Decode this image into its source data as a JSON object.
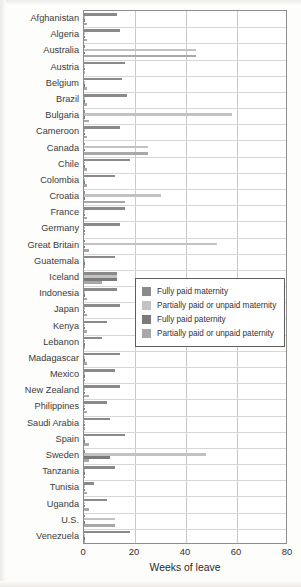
{
  "chart_data": {
    "type": "bar",
    "orientation": "horizontal",
    "title": "",
    "xlabel": "Weeks of leave",
    "ylabel": "",
    "xlim": [
      0,
      80
    ],
    "xticks": [
      0,
      20,
      40,
      60,
      80
    ],
    "grid": true,
    "legend_position": "center-right",
    "categories": [
      "Afghanistan",
      "Algeria",
      "Australia",
      "Austria",
      "Belgium",
      "Brazil",
      "Bulgaria",
      "Cameroon",
      "Canada",
      "Chile",
      "Colombia",
      "Croatia",
      "France",
      "Germany",
      "Great Britain",
      "Guatemala",
      "Iceland",
      "Indonesia",
      "Japan",
      "Kenya",
      "Lebanon",
      "Madagascar",
      "Mexico",
      "New Zealand",
      "Philippines",
      "Saudi Arabia",
      "Spain",
      "Sweden",
      "Tanzania",
      "Tunisia",
      "Uganda",
      "U.S.",
      "Venezuela"
    ],
    "series": [
      {
        "name": "Fully paid maternity",
        "color": "#8a8a8a",
        "values": [
          13,
          14,
          0,
          16,
          15,
          17,
          0,
          14,
          0,
          18,
          12,
          0,
          16,
          14,
          0,
          12,
          13,
          13,
          14,
          9,
          7,
          14,
          12,
          14,
          9,
          10,
          16,
          0,
          12,
          4,
          9,
          0,
          18
        ]
      },
      {
        "name": "Partially paid or unpaid maternity",
        "color": "#c2c2c2",
        "values": [
          0,
          0,
          44,
          0,
          0,
          0,
          58,
          0,
          25,
          0,
          0,
          30,
          0,
          0,
          52,
          0,
          13,
          0,
          0,
          0,
          0,
          0,
          0,
          0,
          0,
          0,
          0,
          48,
          0,
          0,
          0,
          12,
          0
        ]
      },
      {
        "name": "Fully paid paternity",
        "color": "#7a7a7a",
        "values": [
          0,
          0,
          0,
          0,
          0,
          0,
          0,
          0,
          0,
          0,
          0,
          0,
          0,
          0,
          0,
          0,
          13,
          0,
          0,
          0,
          0,
          0,
          0,
          0,
          0,
          0,
          0,
          10,
          0,
          0,
          0,
          0,
          0
        ]
      },
      {
        "name": "Partially paid or unpaid paternity",
        "color": "#a8a8a8",
        "values": [
          1,
          1,
          44,
          0,
          1,
          1,
          2,
          1,
          25,
          1,
          1,
          16,
          1,
          0,
          2,
          0,
          7,
          1,
          1,
          1,
          0,
          1,
          0,
          2,
          1,
          0,
          2,
          2,
          0,
          1,
          2,
          12,
          0
        ]
      }
    ]
  },
  "legend": {
    "items": [
      {
        "label": "Fully paid maternity",
        "color": "#8a8a8a"
      },
      {
        "label": "Partially paid or unpaid maternity",
        "color": "#c2c2c2"
      },
      {
        "label": "Fully paid paternity",
        "color": "#7a7a7a"
      },
      {
        "label": "Partially paid or unpaid paternity",
        "color": "#a8a8a8"
      }
    ]
  },
  "axis": {
    "x_title": "Weeks of leave",
    "x_ticks": [
      "0",
      "20",
      "40",
      "60",
      "80"
    ]
  }
}
